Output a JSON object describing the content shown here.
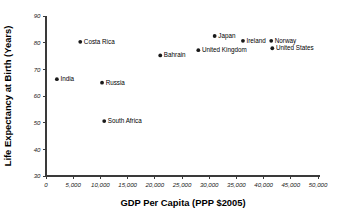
{
  "chart_data": {
    "type": "scatter",
    "title": "",
    "xlabel": "GDP Per Capita (PPP $2005)",
    "ylabel": "Life Expectancy at Birth (Years)",
    "xlim": [
      0,
      50000
    ],
    "ylim": [
      30,
      90
    ],
    "grid": false,
    "legend": "none",
    "xticks": [
      0,
      5000,
      10000,
      15000,
      20000,
      25000,
      30000,
      35000,
      40000,
      45000,
      50000
    ],
    "xtick_labels": [
      "0",
      "5,000",
      "10,000",
      "15,000",
      "20,000",
      "25,000",
      "30,000",
      "35,000",
      "40,000",
      "45,000",
      "50,000"
    ],
    "yticks": [
      30,
      40,
      50,
      60,
      70,
      80,
      90
    ],
    "ytick_labels": [
      "30",
      "40",
      "50",
      "60",
      "70",
      "80",
      "90"
    ],
    "marker_color": "#1a1a1a",
    "points": [
      {
        "label": "India",
        "x": 2000,
        "y": 66.3
      },
      {
        "label": "Costa Rica",
        "x": 6300,
        "y": 80.3
      },
      {
        "label": "Russia",
        "x": 10300,
        "y": 65.0
      },
      {
        "label": "South Africa",
        "x": 10700,
        "y": 50.6
      },
      {
        "label": "Bahrain",
        "x": 21000,
        "y": 75.2
      },
      {
        "label": "United Kingdom",
        "x": 28000,
        "y": 77.2
      },
      {
        "label": "Japan",
        "x": 31000,
        "y": 82.5
      },
      {
        "label": "Ireland",
        "x": 36200,
        "y": 80.7
      },
      {
        "label": "Norway",
        "x": 41400,
        "y": 80.7
      },
      {
        "label": "United States",
        "x": 41600,
        "y": 77.9
      }
    ]
  }
}
